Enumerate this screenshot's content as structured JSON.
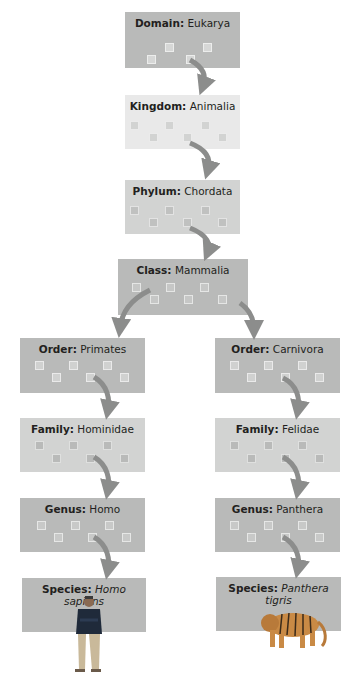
{
  "colors": {
    "domain": "#b9bab9",
    "kingdom": "#e9e9e9",
    "phylum": "#d2d3d2",
    "class": "#b9bab9",
    "order": "#b9bab9",
    "family": "#d2d3d2",
    "genus": "#b9bab9",
    "species": "#b9bab9",
    "arrow": "#8c8d8c"
  },
  "levels": {
    "domain": {
      "rank": "Domain:",
      "name": "Eukarya"
    },
    "kingdom": {
      "rank": "Kingdom:",
      "name": "Animalia"
    },
    "phylum": {
      "rank": "Phylum:",
      "name": "Chordata"
    },
    "class": {
      "rank": "Class:",
      "name": "Mammalia"
    }
  },
  "left_branch": {
    "order": {
      "rank": "Order:",
      "name": "Primates"
    },
    "family": {
      "rank": "Family:",
      "name": "Hominidae"
    },
    "genus": {
      "rank": "Genus:",
      "name": "Homo"
    },
    "species": {
      "rank": "Species:",
      "name": "Homo sapiens",
      "image": "human-figure"
    }
  },
  "right_branch": {
    "order": {
      "rank": "Order:",
      "name": "Carnivora"
    },
    "family": {
      "rank": "Family:",
      "name": "Felidae"
    },
    "genus": {
      "rank": "Genus:",
      "name": "Panthera"
    },
    "species": {
      "rank": "Species:",
      "name": "Panthera tigris",
      "image": "tiger"
    }
  }
}
